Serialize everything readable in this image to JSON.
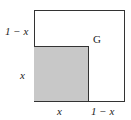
{
  "diagram": {
    "region_label": "G",
    "labels": {
      "left_top": "1 − x",
      "left_bottom": "x",
      "bottom_left": "x",
      "bottom_right": "1 − x"
    },
    "colors": {
      "shaded": "#c8c8c8",
      "stroke": "#333333"
    }
  }
}
